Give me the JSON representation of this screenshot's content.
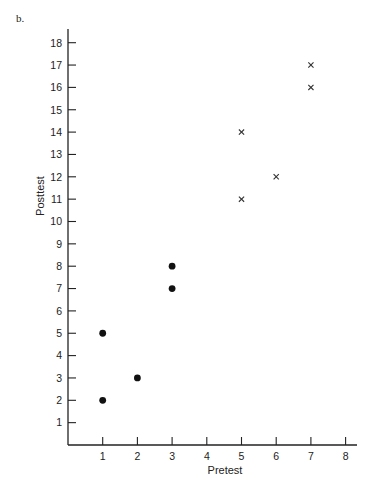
{
  "panel_label": "b.",
  "chart_data": {
    "type": "scatter",
    "title": "",
    "xlabel": "Pretest",
    "ylabel": "Posttest",
    "xlim": [
      0,
      8
    ],
    "ylim": [
      0,
      18
    ],
    "x_ticks": [
      "1",
      "2",
      "3",
      "4",
      "5",
      "6",
      "7",
      "8"
    ],
    "y_ticks": [
      "1",
      "2",
      "3",
      "4",
      "5",
      "6",
      "7",
      "8",
      "9",
      "10",
      "11",
      "12",
      "13",
      "14",
      "15",
      "16",
      "17",
      "18"
    ],
    "grid": false,
    "legend": null,
    "series": [
      {
        "name": "dots",
        "marker": "filled-circle",
        "points": [
          {
            "x": 1,
            "y": 5
          },
          {
            "x": 1,
            "y": 2
          },
          {
            "x": 2,
            "y": 3
          },
          {
            "x": 3,
            "y": 8
          },
          {
            "x": 3,
            "y": 7
          }
        ]
      },
      {
        "name": "crosses",
        "marker": "x",
        "points": [
          {
            "x": 5,
            "y": 14
          },
          {
            "x": 5,
            "y": 11
          },
          {
            "x": 6,
            "y": 12
          },
          {
            "x": 7,
            "y": 17
          },
          {
            "x": 7,
            "y": 16
          }
        ]
      }
    ]
  },
  "colors": {
    "axis": "#222222",
    "marker": "#111111"
  }
}
